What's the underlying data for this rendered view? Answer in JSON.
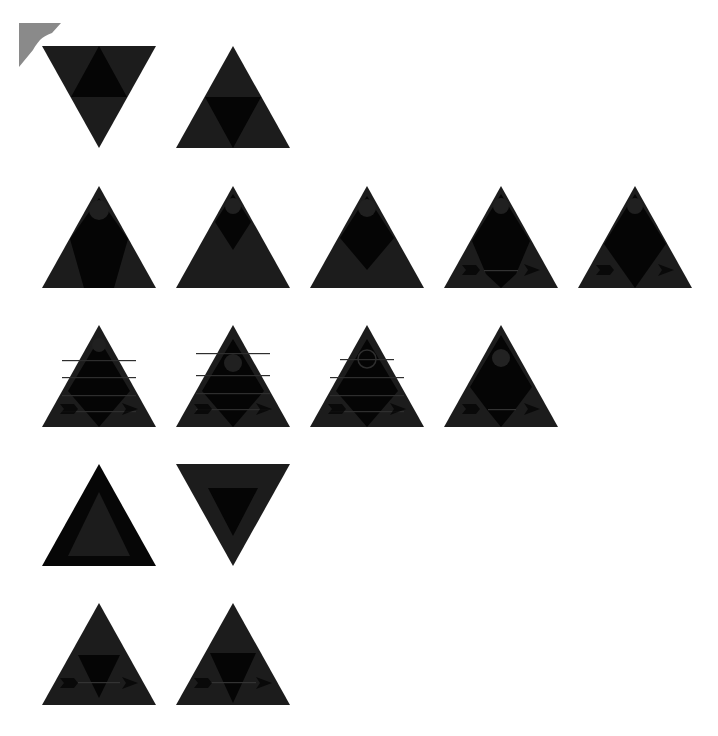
{
  "canvas": {
    "width": 718,
    "height": 736,
    "background": "#ffffff"
  },
  "colors": {
    "body": "#1c1c1c",
    "dark": "#050505",
    "mid": "#262626",
    "corner": "#8a8a8a"
  },
  "corner_marker": {
    "icon": "corner-bracket-icon",
    "color": "#8a8a8a"
  },
  "rows": [
    {
      "tiles": [
        {
          "icon": "triangle-down-inner-up",
          "x": 42,
          "y": 46,
          "variant": "down-inner-up"
        },
        {
          "icon": "triangle-up-inner-down",
          "x": 176,
          "y": 46,
          "variant": "up-inner-down"
        }
      ]
    },
    {
      "tiles": [
        {
          "icon": "triangle-up-diamond-large",
          "x": 42,
          "y": 186,
          "variant": "diamond-large"
        },
        {
          "icon": "triangle-up-diamond-small",
          "x": 176,
          "y": 186,
          "variant": "diamond-small"
        },
        {
          "icon": "triangle-up-diamond-medium",
          "x": 310,
          "y": 186,
          "variant": "diamond-medium"
        },
        {
          "icon": "triangle-up-diamond-arrows",
          "x": 444,
          "y": 186,
          "variant": "diamond-arrows"
        },
        {
          "icon": "triangle-up-diamond-arrows-tall",
          "x": 578,
          "y": 186,
          "variant": "diamond-arrows-tall"
        }
      ]
    },
    {
      "tiles": [
        {
          "icon": "triangle-up-striped-arrows",
          "x": 42,
          "y": 325,
          "variant": "striped-arrows"
        },
        {
          "icon": "triangle-up-striped-circle-arrows",
          "x": 176,
          "y": 325,
          "variant": "striped-circle-arrows"
        },
        {
          "icon": "triangle-up-ring-arrows",
          "x": 310,
          "y": 325,
          "variant": "ring-arrows"
        },
        {
          "icon": "triangle-up-dot-arrows",
          "x": 444,
          "y": 325,
          "variant": "dot-arrows"
        }
      ]
    },
    {
      "tiles": [
        {
          "icon": "triangle-up-outline",
          "x": 42,
          "y": 464,
          "variant": "outline-up"
        },
        {
          "icon": "triangle-down-inner-down",
          "x": 176,
          "y": 464,
          "variant": "outline-down"
        }
      ]
    },
    {
      "tiles": [
        {
          "icon": "triangle-up-small-inner-arrows",
          "x": 42,
          "y": 603,
          "variant": "inner-arrows"
        },
        {
          "icon": "triangle-up-wide-inner-arrows",
          "x": 176,
          "y": 603,
          "variant": "inner-arrows-wide"
        }
      ]
    }
  ]
}
